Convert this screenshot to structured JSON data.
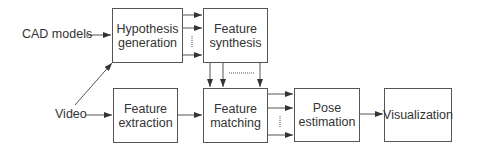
{
  "inputs": {
    "cad_models": "CAD models",
    "video": "Video"
  },
  "boxes": {
    "hypothesis_generation": "Hypothesis\ngeneration",
    "feature_synthesis": "Feature\nsynthesis",
    "feature_extraction": "Feature\nextraction",
    "feature_matching": "Feature\nmatching",
    "pose_estimation": "Pose\nestimation",
    "visualization": "Visualization"
  },
  "colors": {
    "stroke": "#555555",
    "text": "#333333",
    "background": "#ffffff"
  }
}
